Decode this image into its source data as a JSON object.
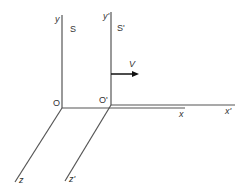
{
  "diagram": {
    "frame_s": {
      "name": "S",
      "origin": "O",
      "x_axis": "x",
      "y_axis": "y",
      "z_axis": "z"
    },
    "frame_s_prime": {
      "name": "S'",
      "origin": "O'",
      "x_axis": "x'",
      "y_axis": "y'",
      "z_axis": "z'"
    },
    "velocity": {
      "label": "V",
      "direction": "+x"
    },
    "colors": {
      "axis": "#555555",
      "arrow": "#111111",
      "text": "#333333"
    }
  }
}
